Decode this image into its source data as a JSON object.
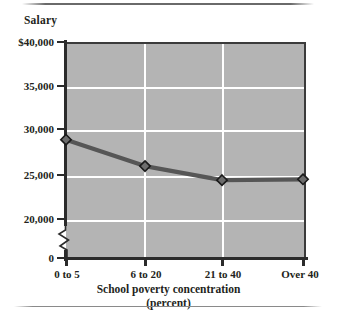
{
  "figure": {
    "top_rule": "horizontal-rule",
    "bottom_rule": "horizontal-rule"
  },
  "chart_data": {
    "type": "line",
    "title": "",
    "ylabel": "Salary",
    "xlabel": "School poverty concentration",
    "xlabel_line2": "(percent)",
    "categories": [
      "0 to 5",
      "6 to 20",
      "21 to 40",
      "Over 40"
    ],
    "values": [
      28900,
      25900,
      24300,
      24400
    ],
    "ytick_labels": [
      "$40,000",
      "35,000",
      "30,000",
      "25,000",
      "20,000",
      "0"
    ],
    "ytick_values": [
      40000,
      35000,
      30000,
      25000,
      20000,
      0
    ],
    "ylim": [
      20000,
      40000
    ],
    "axis_break": true,
    "grid": "horizontal-and-vertical",
    "legend": "none",
    "series": [
      {
        "name": "Salary",
        "values": [
          28900,
          25900,
          24300,
          24400
        ]
      }
    ],
    "colors": {
      "plot_background": "#b4b4b4",
      "gridline": "#ffffff",
      "line": "#565656",
      "marker_fill": "#6d6d6d",
      "marker_edge": "#1a1a1a",
      "axis": "#2b2b2b",
      "text": "#231f20"
    },
    "marker": "diamond"
  }
}
